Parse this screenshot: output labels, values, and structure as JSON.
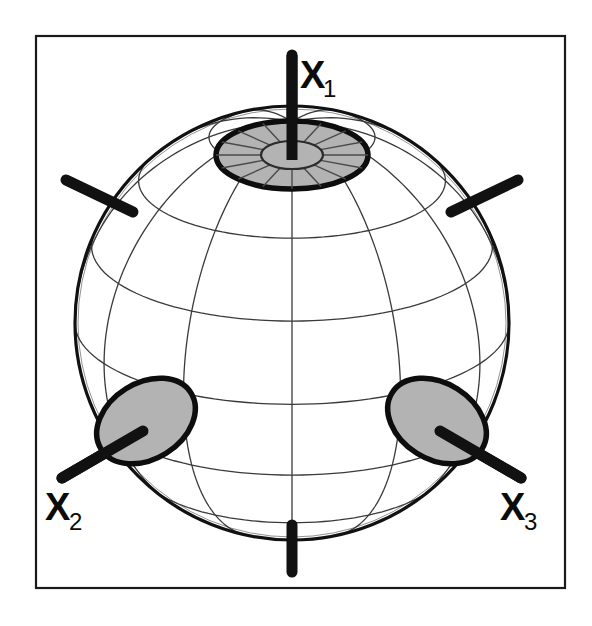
{
  "figure": {
    "background_color": "#ffffff",
    "frame": {
      "x": 36,
      "y": 36,
      "width": 529,
      "height": 552,
      "stroke_color": "#1a1a1a",
      "stroke_width": 2.2
    }
  },
  "sphere": {
    "center_x": 292,
    "center_y": 323,
    "radius": 217,
    "outline_color": "#111111",
    "outline_width": 3.2,
    "grid_color": "#3a3a3a",
    "grid_width": 1.3,
    "latitude_count": 7,
    "longitude_count": 12,
    "tilt_degrees": 22
  },
  "style": {
    "cap_fill": "#b3b3b3",
    "cap_stroke": "#0d0d0d",
    "cap_stroke_width": 5.5,
    "axis_stub_color": "#111111",
    "axis_stub_width": 11,
    "label_color": "#0b0b0b"
  },
  "axes": [
    {
      "id": "x1",
      "label": "X",
      "subscript": "1",
      "label_x": 300,
      "label_y": 88,
      "sub_x": 323,
      "sub_y": 97,
      "has_label": true,
      "direction": "up",
      "stub_x1": 292,
      "stub_y1": 55,
      "stub_x2": 292,
      "stub_y2": 160,
      "cap": {
        "type": "polar-rings",
        "cx": 292,
        "cy": 155,
        "outer_rx": 76,
        "outer_ry": 34,
        "inner_rx": 31,
        "inner_ry": 14,
        "spokes": 16
      }
    },
    {
      "id": "x2",
      "label": "X",
      "subscript": "2",
      "label_x": 45,
      "label_y": 520,
      "sub_x": 69,
      "sub_y": 530,
      "has_label": true,
      "direction": "lower-left",
      "stub_x1": 62,
      "stub_y1": 478,
      "stub_x2": 143,
      "stub_y2": 431,
      "cap": {
        "type": "ellipse",
        "cx": 146,
        "cy": 421,
        "rx": 53,
        "ry": 38,
        "rotation": -32
      }
    },
    {
      "id": "x3",
      "label": "X",
      "subscript": "3",
      "label_x": 500,
      "label_y": 520,
      "sub_x": 524,
      "sub_y": 530,
      "has_label": true,
      "direction": "lower-right",
      "stub_x1": 521,
      "stub_y1": 478,
      "stub_x2": 440,
      "stub_y2": 431,
      "cap": {
        "type": "ellipse",
        "cx": 437,
        "cy": 421,
        "rx": 53,
        "ry": 38,
        "rotation": 32
      }
    },
    {
      "id": "x1-negative",
      "label": "",
      "subscript": "",
      "has_label": false,
      "direction": "down",
      "stub_x1": 292,
      "stub_y1": 525,
      "stub_x2": 292,
      "stub_y2": 572,
      "cap": null
    },
    {
      "id": "x2-negative",
      "label": "",
      "subscript": "",
      "has_label": false,
      "direction": "upper-left",
      "stub_x1": 66,
      "stub_y1": 180,
      "stub_x2": 133,
      "stub_y2": 212,
      "cap": null
    },
    {
      "id": "x3-negative",
      "label": "",
      "subscript": "",
      "has_label": false,
      "direction": "upper-right",
      "stub_x1": 518,
      "stub_y1": 180,
      "stub_x2": 451,
      "stub_y2": 212,
      "cap": null
    }
  ],
  "chart_data": {
    "type": "scatter",
    "xlabel": "",
    "ylabel": "",
    "categories": [
      "X1",
      "X2",
      "X3"
    ],
    "annotations": [
      "X1",
      "X2",
      "X3"
    ],
    "series": [
      {
        "name": "axis intersections (shaded caps)",
        "points": [
          {
            "label": "X1",
            "screen_x": 292,
            "screen_y": 155,
            "cap_radius_px": 76
          },
          {
            "label": "X2",
            "screen_x": 146,
            "screen_y": 421,
            "cap_radius_px": 53
          },
          {
            "label": "X3",
            "screen_x": 437,
            "screen_y": 421,
            "cap_radius_px": 53
          }
        ]
      }
    ],
    "legend_position": "none",
    "grid": true
  }
}
